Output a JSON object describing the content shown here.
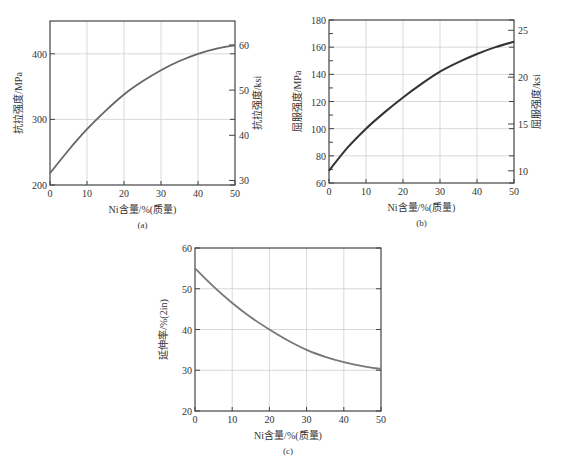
{
  "chart_data": [
    {
      "id": "a",
      "type": "line",
      "caption": "(a)",
      "xlabel": "Ni含量/%(质量)",
      "ylabel": "抗拉强度/MPa",
      "y2label": "抗拉强度/ksi",
      "xlim": [
        0,
        50
      ],
      "ylim": [
        200,
        450
      ],
      "y2lim": [
        29.0,
        65.3
      ],
      "xticks": [
        0,
        10,
        20,
        30,
        40,
        50
      ],
      "yticks": [
        200,
        300,
        400
      ],
      "y2ticks": [
        30,
        40,
        50,
        60
      ],
      "grid": true,
      "series": [
        {
          "name": "Tensile strength",
          "x": [
            0,
            5,
            10,
            15,
            20,
            25,
            30,
            35,
            40,
            45,
            50
          ],
          "values": [
            218,
            253,
            285,
            313,
            338,
            358,
            375,
            389,
            400,
            408,
            413
          ]
        }
      ]
    },
    {
      "id": "b",
      "type": "line",
      "caption": "(b)",
      "xlabel": "Ni含量/%(质量)",
      "ylabel": "屈服强度/MPa",
      "y2label": "屈服强度/ksi",
      "xlim": [
        0,
        50
      ],
      "ylim": [
        60,
        180
      ],
      "y2lim": [
        8.7,
        26.1
      ],
      "xticks": [
        0,
        10,
        20,
        30,
        40,
        50
      ],
      "yticks": [
        60,
        80,
        100,
        120,
        140,
        160,
        180
      ],
      "y2ticks": [
        10,
        15,
        20,
        25
      ],
      "grid": true,
      "series": [
        {
          "name": "Yield strength",
          "x": [
            0,
            5,
            10,
            15,
            20,
            25,
            30,
            35,
            40,
            45,
            50
          ],
          "values": [
            69,
            86,
            100,
            112,
            123,
            133,
            142,
            149,
            155,
            160,
            164
          ]
        }
      ]
    },
    {
      "id": "c",
      "type": "line",
      "caption": "(c)",
      "xlabel": "Ni含量/%(质量)",
      "ylabel": "延伸率/%(2in)",
      "xlim": [
        0,
        50
      ],
      "ylim": [
        20,
        60
      ],
      "xticks": [
        0,
        10,
        20,
        30,
        40,
        50
      ],
      "yticks": [
        20,
        30,
        40,
        50,
        60
      ],
      "grid": true,
      "series": [
        {
          "name": "Elongation",
          "x": [
            0,
            5,
            10,
            15,
            20,
            25,
            30,
            35,
            40,
            45,
            50
          ],
          "values": [
            55,
            50.5,
            46.5,
            43,
            40,
            37.3,
            35,
            33.3,
            32,
            31,
            30.3
          ]
        }
      ]
    }
  ],
  "layout": {
    "a": {
      "left": 50,
      "top": 21,
      "right": 235,
      "bottom": 185
    },
    "b": {
      "left": 329,
      "top": 20,
      "right": 514,
      "bottom": 183
    },
    "c": {
      "left": 195,
      "top": 248,
      "right": 381,
      "bottom": 411
    }
  },
  "colors": {
    "curve_a": "#666666",
    "curve_b": "#333333",
    "curve_c": "#777777"
  }
}
